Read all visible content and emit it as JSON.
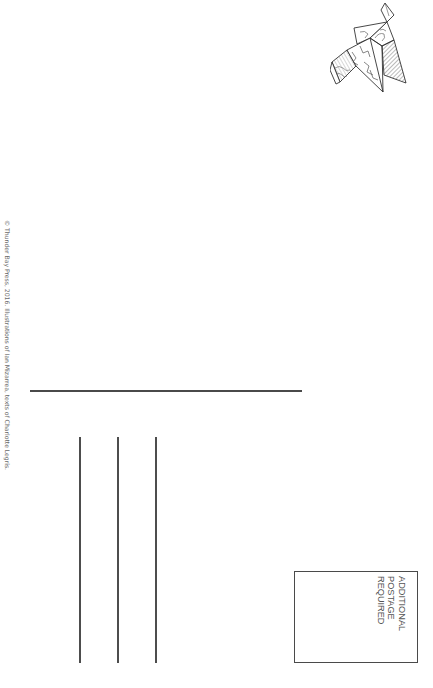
{
  "postcard": {
    "copyright_text": "© Thunder Bay Press, 2016. Illustrations of Ian Mizarrea, texts of Charlotte Legris.",
    "stamp_box": {
      "lines": [
        "ADDITIONAL",
        "POSTAGE",
        "REQUIRED"
      ]
    },
    "address_lines_count": 3,
    "illustration": "origami-bird-icon",
    "colors": {
      "background": "#ffffff",
      "line": "#4a4a4a",
      "text": "#555555"
    }
  }
}
